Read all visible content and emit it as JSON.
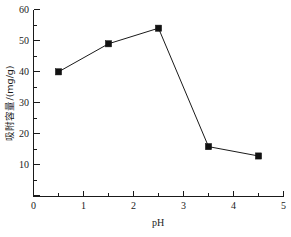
{
  "chart_data": {
    "type": "line",
    "title": "",
    "subtitle": "",
    "xlabel": "pH",
    "ylabel": "吸附容量/(mg/g)",
    "xlim": [
      0,
      5
    ],
    "ylim": [
      0,
      60
    ],
    "grid": false,
    "legend": null,
    "marker": "filled-square",
    "line_color": "#1a1a1a",
    "marker_color": "#111111",
    "x": [
      0.5,
      1.5,
      2.5,
      3.5,
      4.5
    ],
    "values": [
      40,
      49,
      54,
      16,
      13
    ],
    "series": [
      {
        "name": "吸附容量",
        "x": [
          0.5,
          1.5,
          2.5,
          3.5,
          4.5
        ],
        "values": [
          40,
          49,
          54,
          16,
          13
        ]
      }
    ],
    "x_ticks": [
      0,
      1,
      2,
      3,
      4,
      5
    ],
    "x_tick_labels": [
      "0",
      "1",
      "2",
      "3",
      "4",
      "5"
    ],
    "x_minor_ticks": [
      0.5,
      1.5,
      2.5,
      3.5,
      4.5
    ],
    "y_ticks": [
      0,
      10,
      20,
      30,
      40,
      50,
      60
    ],
    "y_tick_labels": [
      "0",
      "10",
      "20",
      "30",
      "40",
      "50",
      "60"
    ],
    "y_minor_ticks": [
      5,
      15,
      25,
      35,
      45,
      55
    ],
    "annotations": []
  },
  "axis": {
    "x_title": "pH",
    "y_title": "吸附容量/(mg/g)"
  },
  "ticks": {
    "y": {
      "t60": "60",
      "t50": "50",
      "t40": "40",
      "t30": "30",
      "t20": "20",
      "t10": "10"
    },
    "x": {
      "t0": "0",
      "t1": "1",
      "t2": "2",
      "t3": "3",
      "t4": "4",
      "t5": "5"
    }
  }
}
